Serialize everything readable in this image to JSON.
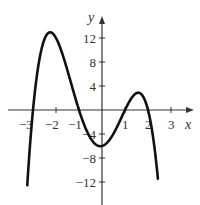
{
  "chart_data": {
    "type": "line",
    "title": "",
    "xlabel": "x",
    "ylabel": "y",
    "function": "y = -(x+3)(x+1)(x-1)(x-2)",
    "x_ticks": [
      -3,
      -2,
      -1,
      1,
      2,
      3
    ],
    "x_tick_labels": [
      "-3",
      "-2",
      "-1",
      "1",
      "2",
      "3"
    ],
    "y_ticks": [
      12,
      8,
      4,
      -4,
      -8,
      -12
    ],
    "y_tick_labels": [
      "12",
      "8",
      "4",
      "-4",
      "-8",
      "-12"
    ],
    "xlim": [
      -3.4,
      3.4
    ],
    "ylim": [
      -16,
      16
    ],
    "grid": false,
    "series": [
      {
        "name": "f(x)",
        "x": [
          -3.15,
          -3.0,
          -2.8,
          -2.6,
          -2.4,
          -2.2,
          -2.0,
          -1.8,
          -1.6,
          -1.4,
          -1.2,
          -1.0,
          -0.8,
          -0.6,
          -0.4,
          -0.2,
          0.0,
          0.2,
          0.4,
          0.6,
          0.8,
          1.0,
          1.2,
          1.4,
          1.6,
          1.8,
          2.0,
          2.2,
          2.35
        ],
        "values": [
          -4.4,
          0,
          4.6,
          8.7,
          11.7,
          12.9,
          12.0,
          9.8,
          6.9,
          3.5,
          1.3,
          0,
          -2.1,
          -3.9,
          -5.2,
          -5.9,
          -6.0,
          -5.6,
          -4.7,
          -3.4,
          -1.9,
          0,
          1.6,
          2.6,
          2.9,
          2.3,
          0,
          -4.1,
          -8.9
        ]
      }
    ],
    "roots": [
      -3,
      -1,
      1,
      2
    ],
    "y_intercept": -6,
    "local_max": [
      {
        "x": -2.2,
        "y": 12.9
      },
      {
        "x": 1.6,
        "y": 2.9
      }
    ],
    "local_min": [
      {
        "x": -0.05,
        "y": -6.0
      }
    ]
  },
  "labels": {
    "x_axis": "x",
    "y_axis": "y",
    "xt_m3": "−3",
    "xt_m2": "−2",
    "xt_m1": "−1",
    "xt_1": "1",
    "xt_2": "2",
    "xt_3": "3",
    "yt_12": "12",
    "yt_8": "8",
    "yt_4": "4",
    "yt_m4": "−4",
    "yt_m8": "−8",
    "yt_m12": "−12"
  }
}
